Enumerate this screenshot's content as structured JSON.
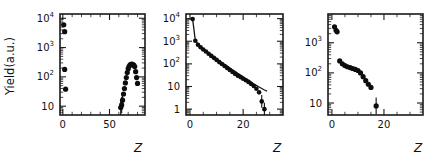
{
  "figure": {
    "ylabel": "Yield(a.u.)",
    "xlabel": "Z",
    "background": "#ffffff",
    "marker_color": "#0d0d0d",
    "axis_color": "#1a1a1a"
  },
  "chart_data": [
    {
      "type": "scatter",
      "panel": 1,
      "title": "",
      "xlabel": "Z",
      "ylabel": "Yield(a.u.)",
      "xlim": [
        -3,
        88
      ],
      "ylim": [
        5,
        14000
      ],
      "yscale": "log",
      "xticks": [
        0,
        50
      ],
      "xticklabels": [
        "0",
        "50"
      ],
      "xticks_minor": [
        10,
        20,
        30,
        40,
        60,
        70,
        80
      ],
      "yticklabels": [
        "10^4",
        "10^3",
        "10^2",
        "10"
      ],
      "ytickvalues": [
        10000,
        1000,
        100,
        10
      ],
      "grid": false,
      "legend": null,
      "x": [
        1,
        2,
        2,
        3,
        62,
        63,
        64,
        65,
        66,
        67,
        68,
        69,
        70,
        71,
        72,
        73,
        74,
        75,
        76,
        77,
        78,
        79,
        80
      ],
      "y": [
        6000,
        3500,
        180,
        38,
        9,
        11,
        16,
        26,
        40,
        62,
        95,
        140,
        190,
        230,
        255,
        270,
        272,
        265,
        250,
        225,
        150,
        95,
        60
      ]
    },
    {
      "type": "scatter",
      "panel": 2,
      "title": "",
      "xlabel": "Z",
      "xlim": [
        -1.5,
        35
      ],
      "ylim": [
        0.55,
        16000
      ],
      "yscale": "log",
      "xticks": [
        0,
        20
      ],
      "xticklabels": [
        "0",
        "20"
      ],
      "xticks_minor": [
        5,
        10,
        15,
        25,
        30
      ],
      "yticklabels": [
        "10^4",
        "10^3",
        "10^2",
        "10",
        "1"
      ],
      "ytickvalues": [
        10000,
        1000,
        100,
        10,
        1
      ],
      "grid": false,
      "legend": null,
      "has_fit_curve": true,
      "x": [
        1,
        2,
        3,
        4,
        5,
        6,
        7,
        8,
        9,
        10,
        11,
        12,
        13,
        14,
        15,
        16,
        17,
        18,
        19,
        20,
        21,
        22,
        23,
        24,
        25,
        26,
        27,
        28
      ],
      "y": [
        9500,
        1050,
        700,
        540,
        430,
        350,
        280,
        225,
        185,
        150,
        120,
        98,
        80,
        65,
        54,
        44,
        36,
        30,
        26,
        22,
        19,
        16,
        13,
        10.5,
        8,
        5.5,
        2.2,
        1.0
      ],
      "fit_x": [
        1,
        2,
        4,
        6,
        8,
        10,
        12,
        14,
        16,
        18,
        20,
        22,
        24,
        26,
        28,
        29
      ],
      "fit_y": [
        9500,
        1100,
        560,
        370,
        250,
        170,
        115,
        80,
        55,
        38,
        27,
        19,
        13,
        9.5,
        7,
        6.2
      ]
    },
    {
      "type": "scatter",
      "panel": 3,
      "title": "",
      "xlabel": "Z",
      "xlim": [
        -1.5,
        35
      ],
      "ylim": [
        4,
        9000
      ],
      "yscale": "log",
      "xticks": [
        0,
        20
      ],
      "xticklabels": [
        "0",
        "20"
      ],
      "xticks_minor": [
        5,
        10,
        15,
        25,
        30
      ],
      "yticklabels": [
        "10^3",
        "10^2",
        "10"
      ],
      "ytickvalues": [
        1000,
        100,
        10
      ],
      "grid": false,
      "legend": null,
      "x": [
        1,
        1.6,
        2,
        3,
        4,
        5,
        6,
        7,
        8,
        9,
        10,
        11,
        12,
        13,
        14,
        15,
        17
      ],
      "y": [
        3400,
        2600,
        2300,
        250,
        200,
        175,
        160,
        150,
        140,
        130,
        120,
        100,
        75,
        55,
        42,
        33,
        8
      ]
    }
  ]
}
